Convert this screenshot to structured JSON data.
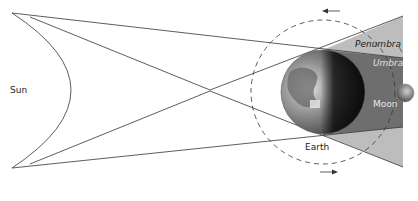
{
  "diagram": {
    "labels": {
      "sun": "Sun",
      "earth": "Earth",
      "moon": "Moon",
      "penumbra": "Penumbra",
      "umbra": "Umbra"
    },
    "colors": {
      "background": "#ffffff",
      "lines": "#333333",
      "penumbra": "#bdbdbd",
      "umbra": "#6e6e6e",
      "label_dark": "#222222",
      "label_light": "#e8e8e8"
    },
    "orbit_direction": "counter-clockwise"
  }
}
